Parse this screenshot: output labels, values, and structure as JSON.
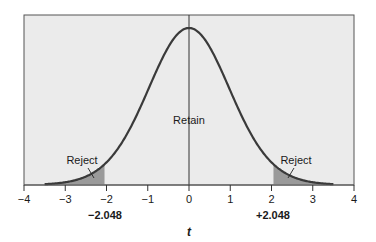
{
  "chart_data": {
    "type": "line",
    "title": "",
    "xlabel": "t",
    "ylabel": "",
    "xlim": [
      -4,
      4
    ],
    "x_ticks": [
      -4,
      -3,
      -2,
      -1,
      0,
      1,
      2,
      3,
      4
    ],
    "x_tick_labels": [
      "−4",
      "−3",
      "−2",
      "−1",
      "0",
      "1",
      "2",
      "3",
      "4"
    ],
    "grid": false,
    "legend": null,
    "critical_values": [
      -2.048,
      2.048
    ],
    "critical_value_labels": [
      "−2.048",
      "+2.048"
    ],
    "curve_extent": [
      -3.5,
      3.5
    ],
    "regions": [
      {
        "name": "reject-left",
        "label": "Reject",
        "from": -3.5,
        "to": -2.048,
        "shaded": true
      },
      {
        "name": "retain",
        "label": "Retain",
        "from": -2.048,
        "to": 2.048,
        "shaded": false
      },
      {
        "name": "reject-right",
        "label": "Reject",
        "from": 2.048,
        "to": 3.5,
        "shaded": true
      }
    ],
    "center_line_x": 0,
    "colors": {
      "plot_background": "#ebebeb",
      "curve": "#3a3a3a",
      "shaded_tail": "#9a9a9a",
      "frame": "#555555"
    }
  },
  "labels": {
    "retain": "Retain",
    "reject_left": "Reject",
    "reject_right": "Reject",
    "crit_left": "−2.048",
    "crit_right": "+2.048",
    "x_axis_title": "t",
    "ticks": [
      "−4",
      "−3",
      "−2",
      "−1",
      "0",
      "1",
      "2",
      "3",
      "4"
    ]
  }
}
